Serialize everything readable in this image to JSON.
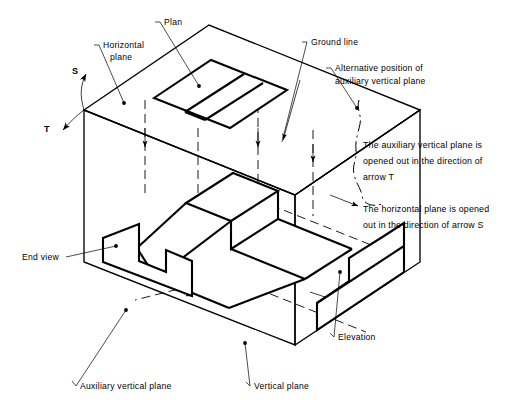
{
  "figure": {
    "type": "engineering-orthographic-projection-diagram"
  },
  "labels": {
    "plan": "Plan",
    "horizontal_plane_line1": "Horizontal",
    "horizontal_plane_line2": "plane",
    "ground_line": "Ground line",
    "alternative_line1": "Alternative position of",
    "alternative_line2": "auxiliary vertical plane",
    "end_view": "End view",
    "elevation": "Elevation",
    "auxiliary_vertical_plane": "Auxiliary vertical plane",
    "vertical_plane": "Vertical plane",
    "arrow_s": "S",
    "arrow_t": "T"
  },
  "notes": {
    "note_t": {
      "line1": "The auxiliary vertical plane is",
      "line2": "opened out in the direction of",
      "line3": "arrow T"
    },
    "note_s": {
      "line1": "The horizontal plane is opened",
      "line2": "out in the direction of arrow S"
    }
  },
  "colors": {
    "ink": "#000000",
    "paper": "#ffffff"
  }
}
